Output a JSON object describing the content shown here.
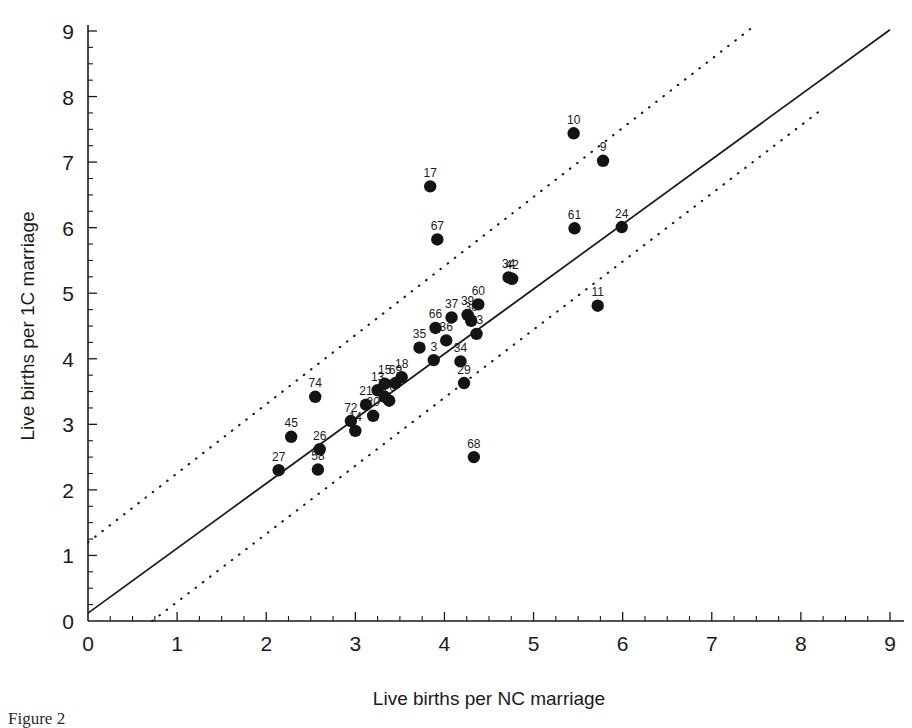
{
  "figure": {
    "caption": "Figure 2",
    "background_color": "#ffffff",
    "ink_color": "#1a1a1a",
    "point_color": "#141414"
  },
  "chart_data": {
    "type": "scatter",
    "title": "",
    "xlabel": "Live births per NC marriage",
    "ylabel": "Live births per 1C marriage",
    "xlim": [
      0,
      9
    ],
    "ylim": [
      0,
      9
    ],
    "xticks": [
      0,
      1,
      2,
      3,
      4,
      5,
      6,
      7,
      8,
      9
    ],
    "yticks": [
      0,
      1,
      2,
      3,
      4,
      5,
      6,
      7,
      8,
      9
    ],
    "xtick_labels": [
      "0",
      "1",
      "2",
      "3",
      "4",
      "5",
      "6",
      "7",
      "8",
      "9"
    ],
    "ytick_labels": [
      "0",
      "1",
      "2",
      "3",
      "4",
      "5",
      "6",
      "7",
      "8",
      "9"
    ],
    "minor_tick_step": 0.25,
    "grid": false,
    "legend": false,
    "points": [
      {
        "label": "27",
        "x": 2.14,
        "y": 2.3
      },
      {
        "label": "45",
        "x": 2.28,
        "y": 2.81
      },
      {
        "label": "58",
        "x": 2.58,
        "y": 2.31
      },
      {
        "label": "26",
        "x": 2.6,
        "y": 2.62
      },
      {
        "label": "74",
        "x": 2.55,
        "y": 3.42
      },
      {
        "label": "72",
        "x": 2.95,
        "y": 3.05
      },
      {
        "label": "14",
        "x": 3.0,
        "y": 2.9
      },
      {
        "label": "21",
        "x": 3.12,
        "y": 3.3
      },
      {
        "label": "20",
        "x": 3.2,
        "y": 3.13
      },
      {
        "label": "13",
        "x": 3.25,
        "y": 3.52
      },
      {
        "label": "15",
        "x": 3.33,
        "y": 3.62
      },
      {
        "label": "69",
        "x": 3.45,
        "y": 3.63
      },
      {
        "label": "8",
        "x": 3.33,
        "y": 3.42
      },
      {
        "label": "70",
        "x": 3.38,
        "y": 3.36
      },
      {
        "label": "18",
        "x": 3.52,
        "y": 3.72
      },
      {
        "label": "35",
        "x": 3.72,
        "y": 4.17
      },
      {
        "label": "66",
        "x": 3.9,
        "y": 4.47
      },
      {
        "label": "3",
        "x": 3.88,
        "y": 3.98
      },
      {
        "label": "36",
        "x": 4.02,
        "y": 4.28
      },
      {
        "label": "37",
        "x": 4.08,
        "y": 4.63
      },
      {
        "label": "39",
        "x": 4.26,
        "y": 4.67
      },
      {
        "label": "30",
        "x": 4.3,
        "y": 4.58
      },
      {
        "label": "60",
        "x": 4.38,
        "y": 4.83
      },
      {
        "label": "33",
        "x": 4.36,
        "y": 4.38
      },
      {
        "label": "34",
        "x": 4.18,
        "y": 3.96
      },
      {
        "label": "29",
        "x": 4.22,
        "y": 3.63
      },
      {
        "label": "68",
        "x": 4.33,
        "y": 2.5
      },
      {
        "label": "17",
        "x": 3.84,
        "y": 6.63
      },
      {
        "label": "67",
        "x": 3.92,
        "y": 5.82
      },
      {
        "label": "34",
        "x": 4.72,
        "y": 5.24
      },
      {
        "label": "42",
        "x": 4.76,
        "y": 5.22
      },
      {
        "label": "11",
        "x": 5.72,
        "y": 4.81
      },
      {
        "label": "10",
        "x": 5.45,
        "y": 7.44
      },
      {
        "label": "9",
        "x": 5.78,
        "y": 7.02
      },
      {
        "label": "61",
        "x": 5.46,
        "y": 5.99
      },
      {
        "label": "24",
        "x": 5.99,
        "y": 6.01
      }
    ],
    "fit_line": {
      "name": "regression-line",
      "style": "solid",
      "x_start": 0.0,
      "y_start": 0.12,
      "x_end": 9.0,
      "y_end": 9.02
    },
    "confidence_bands": [
      {
        "name": "upper-confidence-band",
        "style": "dotted",
        "x_start": 0.0,
        "y_start": 1.2,
        "x_end": 7.45,
        "y_end": 9.05
      },
      {
        "name": "lower-confidence-band",
        "style": "dotted",
        "x_start": 0.72,
        "y_start": 0.0,
        "x_end": 8.25,
        "y_end": 7.82
      }
    ]
  }
}
